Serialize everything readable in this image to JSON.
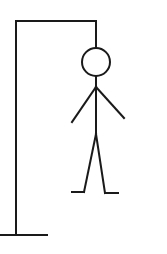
{
  "game": {
    "name": "hangman",
    "wrong_guesses_shown": 6,
    "parts_drawn": [
      "head",
      "body",
      "left-arm",
      "right-arm",
      "left-leg",
      "right-leg"
    ]
  },
  "colors": {
    "background": "#ffffff",
    "stroke": "#1a1a1a"
  }
}
